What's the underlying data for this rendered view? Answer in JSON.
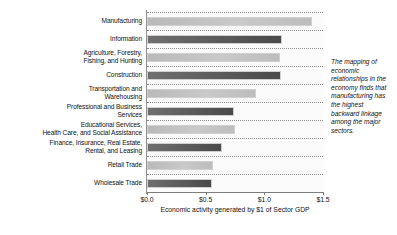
{
  "chart_data": {
    "type": "bar",
    "orientation": "horizontal",
    "title": "",
    "xlabel": "Economic activity generated by $1 of Sector GDP",
    "ylabel": "",
    "xlim": [
      0.0,
      1.5
    ],
    "xticks": [
      0.0,
      0.5,
      1.0,
      1.5
    ],
    "xtick_labels": [
      "$0.0",
      "$0.5",
      "$1.0",
      "$1.5"
    ],
    "grid": true,
    "grid_style": "dotted horizontal",
    "legend": "none",
    "categories": [
      "Manufacturing",
      "Information",
      "Agriculture, Forestry, Fishing, and Hunting",
      "Construction",
      "Transportation and Warehousing",
      "Professional and Business Services",
      "Educational Services, Health Care, and Social Assistance",
      "Finance, Insurance, Real Estate, Rental, and Leasing",
      "Retail Trade",
      "Wholesale Trade"
    ],
    "category_lines": [
      [
        "Manufacturing"
      ],
      [
        "Information"
      ],
      [
        "Agriculture, Forestry,",
        "Fishing, and Hunting"
      ],
      [
        "Construction"
      ],
      [
        "Transportation and",
        "Warehousing"
      ],
      [
        "Professional and Business",
        "Services"
      ],
      [
        "Educational Services,",
        "Health Care, and Social Assistance"
      ],
      [
        "Finance, Insurance, Real Estate,",
        "Rental, and Leasing"
      ],
      [
        "Retail Trade"
      ],
      [
        "Wholesale Trade"
      ]
    ],
    "values": [
      1.41,
      1.15,
      1.13,
      1.14,
      0.93,
      0.74,
      0.75,
      0.64,
      0.56,
      0.55
    ],
    "bar_shades": [
      "light",
      "dark",
      "light",
      "dark",
      "light",
      "dark",
      "light",
      "dark",
      "light",
      "dark"
    ],
    "colors": {
      "bar_light": "#c2c2c2",
      "bar_dark": "#585858",
      "grid": "#8a8a8a",
      "axis": "#7d7d7d",
      "text": "#111111",
      "plot_background": "#fbfbfb"
    }
  },
  "annotation": {
    "text": "The mapping of economic relationships in the economy finds that manufacturing has the highest backward linkage among the major sectors."
  }
}
